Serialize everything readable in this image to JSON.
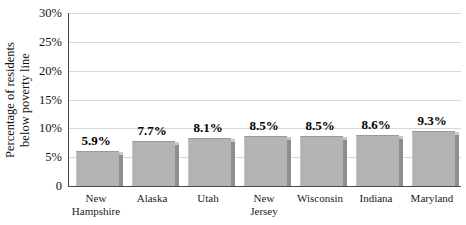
{
  "chart_data": {
    "type": "bar",
    "title": "",
    "xlabel": "",
    "ylabel": "Percentage of residents below poverty line",
    "ylabel_lines": [
      "Percentage of residents",
      "below poverty line"
    ],
    "categories": [
      "New Hampshire",
      "Alaska",
      "Utah",
      "New Jersey",
      "Wisconsin",
      "Indiana",
      "Maryland"
    ],
    "category_lines": [
      [
        "New",
        "Hampshire"
      ],
      [
        "Alaska"
      ],
      [
        "Utah"
      ],
      [
        "New",
        "Jersey"
      ],
      [
        "Wisconsin"
      ],
      [
        "Indiana"
      ],
      [
        "Maryland"
      ]
    ],
    "values": [
      5.9,
      7.7,
      8.1,
      8.5,
      8.5,
      8.6,
      9.3
    ],
    "value_labels": [
      "5.9%",
      "7.7%",
      "8.1%",
      "8.5%",
      "8.5%",
      "8.6%",
      "9.3%"
    ],
    "ylim": [
      0,
      30
    ],
    "ytick_values": [
      0,
      5,
      10,
      15,
      20,
      25,
      30
    ],
    "ytick_labels": [
      "0",
      "5%",
      "10%",
      "15%",
      "20%",
      "25%",
      "30%"
    ],
    "grid": true,
    "legend": "none",
    "bar_color": "#b4b4b4",
    "bar_side_color": "#8d8d8d",
    "gridline_color": "#d8d8d8",
    "axis_color": "#4a4a4a"
  }
}
